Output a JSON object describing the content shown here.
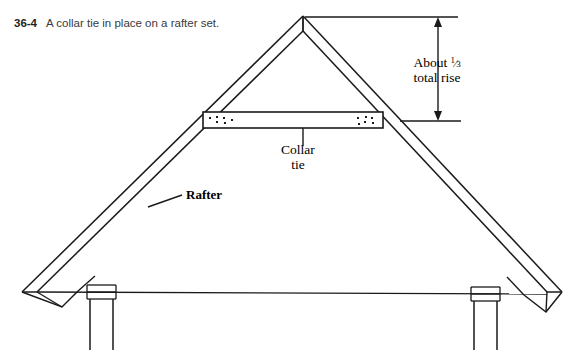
{
  "figure": {
    "number": "36-4",
    "caption": "A collar tie in place on a rafter set."
  },
  "labels": {
    "rafter": "Rafter",
    "collar_line1": "Collar",
    "collar_line2": "tie",
    "rise_line1_prefix": "About ",
    "rise_fraction_numerator": "1",
    "rise_fraction_denominator": "3",
    "rise_line2": "total rise"
  },
  "colors": {
    "line": "#1a1a1a",
    "text": "#000000",
    "caption_text": "#3a3a3a",
    "background": "#ffffff"
  },
  "diagram": {
    "type": "architectural-section",
    "components": [
      "left-rafter",
      "right-rafter",
      "ridge-apex",
      "collar-tie",
      "collar-tie-nails-left",
      "collar-tie-nails-right",
      "ceiling-joist",
      "left-wall-plate",
      "right-wall-plate",
      "left-wall-studs",
      "right-wall-studs",
      "rise-dimension-arrow"
    ]
  }
}
